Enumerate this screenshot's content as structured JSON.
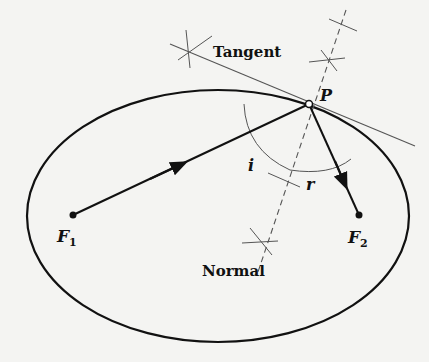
{
  "diagram": {
    "labels": {
      "tangent": "Tangent",
      "normal": "Normal",
      "point": "P",
      "focus1": "F",
      "focus1_sub": "1",
      "focus2": "F",
      "focus2_sub": "2",
      "incidence_angle": "i",
      "reflection_angle": "r"
    },
    "colors": {
      "background": "#f4f4f2",
      "ink": "#111111",
      "construction": "#666666"
    },
    "ellipse": {
      "cx": 218,
      "cy": 216,
      "rx": 191,
      "ry": 126
    },
    "points": {
      "P": [
        309,
        104
      ],
      "F1": [
        73,
        215
      ],
      "F2": [
        359,
        215
      ]
    }
  }
}
